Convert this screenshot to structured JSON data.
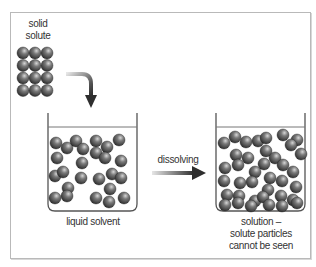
{
  "labels": {
    "solid_solute": [
      "solid",
      "solute"
    ],
    "liquid_solvent": "liquid solvent",
    "process": "dissolving",
    "solution": [
      "solution –",
      "solute particles",
      "cannot be seen"
    ]
  },
  "colors": {
    "frame": "#b9b9b9",
    "beaker": "#555555",
    "particle_dark": "#2e2e2e",
    "particle_light": "#c8c8c8",
    "arrow_dark": "#333333",
    "arrow_light": "#dddddd",
    "text": "#333333"
  },
  "solid_grid": {
    "cols": 3,
    "rows": 4,
    "x0": 23,
    "y0": 53,
    "dx": 12,
    "dy": 12.5,
    "r": 6
  },
  "left_beaker": {
    "particles": [
      [
        56,
        143
      ],
      [
        67,
        148
      ],
      [
        76,
        141
      ],
      [
        83,
        149
      ],
      [
        96,
        141
      ],
      [
        107,
        147
      ],
      [
        119,
        140
      ],
      [
        57,
        158
      ],
      [
        82,
        163
      ],
      [
        96,
        153
      ],
      [
        105,
        158
      ],
      [
        121,
        161
      ],
      [
        55,
        176
      ],
      [
        63,
        172
      ],
      [
        81,
        178
      ],
      [
        99,
        179
      ],
      [
        112,
        174
      ],
      [
        121,
        178
      ],
      [
        68,
        188
      ],
      [
        110,
        189
      ],
      [
        55,
        198
      ],
      [
        67,
        196
      ],
      [
        96,
        198
      ],
      [
        109,
        202
      ],
      [
        124,
        198
      ]
    ],
    "r": 6
  },
  "right_beaker": {
    "particles": [
      [
        224,
        143
      ],
      [
        235,
        137
      ],
      [
        246,
        142
      ],
      [
        258,
        141
      ],
      [
        266,
        138
      ],
      [
        283,
        135
      ],
      [
        297,
        140
      ],
      [
        236,
        155
      ],
      [
        248,
        158
      ],
      [
        266,
        151
      ],
      [
        275,
        158
      ],
      [
        291,
        145
      ],
      [
        301,
        154
      ],
      [
        225,
        168
      ],
      [
        238,
        165
      ],
      [
        255,
        172
      ],
      [
        264,
        164
      ],
      [
        270,
        178
      ],
      [
        283,
        165
      ],
      [
        293,
        172
      ],
      [
        224,
        181
      ],
      [
        240,
        183
      ],
      [
        252,
        182
      ],
      [
        268,
        190
      ],
      [
        282,
        181
      ],
      [
        296,
        187
      ],
      [
        227,
        195
      ],
      [
        239,
        196
      ],
      [
        255,
        201
      ],
      [
        263,
        197
      ],
      [
        281,
        196
      ],
      [
        293,
        200
      ],
      [
        225,
        205
      ],
      [
        238,
        203
      ],
      [
        251,
        206
      ],
      [
        269,
        205
      ],
      [
        282,
        206
      ],
      [
        297,
        203
      ]
    ],
    "r": 6
  }
}
